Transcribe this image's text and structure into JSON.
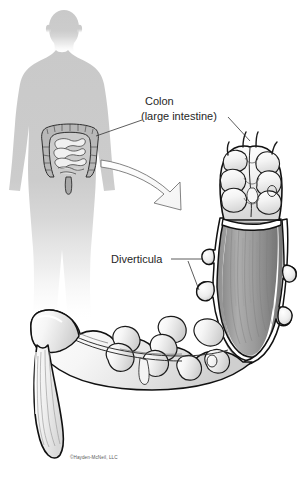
{
  "illustration": {
    "title": "Colon with diverticula — anatomical illustration",
    "background_color": "#ffffff"
  },
  "labels": {
    "colon_line1": "Colon",
    "colon_line2": "(large intestine)",
    "diverticula": "Diverticula"
  },
  "credit": {
    "text": "©Hayden-McNeil, LLC"
  },
  "icons": {
    "body_silhouette": "human-body-silhouette",
    "magnify_arrow": "curved-arrow",
    "colon_diagram": "colon-anatomy",
    "diverticula_pouches": "diverticula-pouch"
  },
  "colors": {
    "silhouette": "#c9c9c9",
    "outline": "#111111",
    "lumen_shading": "#9a9a9a",
    "haustra_fill": "#f2f2f2",
    "text": "#262626",
    "leader_line": "#333333"
  }
}
